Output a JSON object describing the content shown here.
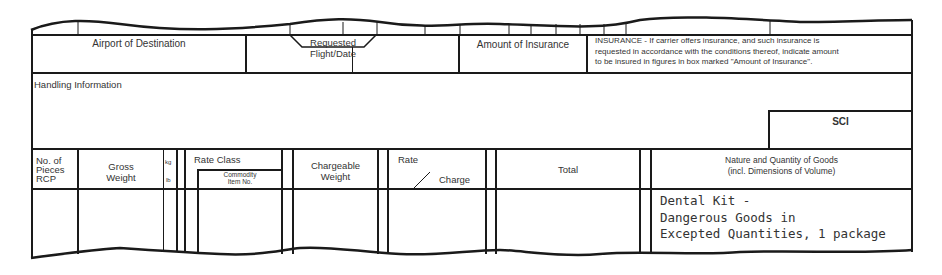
{
  "form": {
    "top_row": {
      "airport_of_destination": "Airport of Destination",
      "requested_flight_date": "Requested Flight/Date",
      "amount_of_insurance": "Amount of Insurance",
      "insurance_notice": [
        "INSURANCE - If carrier offers insurance, and such insurance is",
        "requested in accordance with the conditions thereof, indicate amount",
        "to be insured in figures in box marked \"Amount of Insurance\"."
      ]
    },
    "handling": {
      "label": "Handling Information",
      "sci_label": "SCI"
    },
    "columns": {
      "pieces": [
        "No. of",
        "Pieces",
        "RCP"
      ],
      "gross_weight": [
        "Gross",
        "Weight"
      ],
      "kg": "kg",
      "lb": "lb",
      "rate_class": "Rate Class",
      "commodity_item": [
        "Commodity",
        "Item No."
      ],
      "chargeable_weight": [
        "Chargeable",
        "Weight"
      ],
      "rate": "Rate",
      "charge": "Charge",
      "total": "Total",
      "nature_quantity": [
        "Nature and Quantity of Goods",
        "(incl. Dimensions of Volume)"
      ]
    },
    "goods_description": [
      "Dental Kit -",
      "Dangerous Goods in",
      "Excepted Quantities, 1 package"
    ]
  }
}
